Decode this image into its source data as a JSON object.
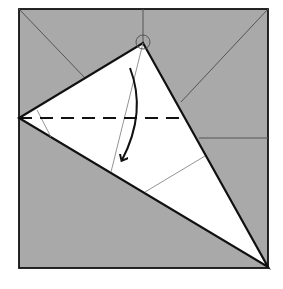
{
  "diagram": {
    "type": "origami-fold-step",
    "width": 283,
    "height": 289,
    "colors": {
      "background": "#ffffff",
      "paper_colored": "#a9a9a9",
      "paper_white": "#ffffff",
      "edge": "#111111",
      "crease": "#555555",
      "thin_crease": "#888888"
    },
    "square": {
      "x1": 19,
      "y1": 9,
      "x2": 268,
      "y2": 268
    },
    "flap_triangle": {
      "apex": [
        143,
        43
      ],
      "left": [
        19,
        118
      ],
      "bottom_right": [
        268,
        267
      ]
    },
    "creases": [
      {
        "name": "top-left-diagonal",
        "from": [
          19,
          9
        ],
        "to": [
          85,
          78
        ]
      },
      {
        "name": "top-right-diagonal",
        "from": [
          268,
          9
        ],
        "to": [
          181,
          102
        ]
      },
      {
        "name": "top-center-vertical",
        "from": [
          143,
          9
        ],
        "to": [
          143,
          43
        ]
      },
      {
        "name": "right-horizontal",
        "from": [
          199,
          138
        ],
        "to": [
          268,
          138
        ]
      }
    ],
    "thin_lines": [
      {
        "name": "apex-to-bottom-line",
        "from": [
          143,
          43
        ],
        "to": [
          111,
          172
        ]
      },
      {
        "name": "right-side-line",
        "from": [
          205,
          156
        ],
        "to": [
          145,
          192
        ]
      },
      {
        "name": "left-small-line",
        "from": [
          37,
          110
        ],
        "to": [
          51,
          137
        ]
      }
    ],
    "valley_fold_line": {
      "from": [
        19,
        118
      ],
      "to": [
        185,
        118
      ],
      "dash": "13 8"
    },
    "reference_circle": {
      "cx": 143,
      "cy": 42,
      "r": 7
    },
    "fold_arrow": {
      "path": "M130 68 Q147 112 122 160",
      "direction": "down"
    }
  }
}
